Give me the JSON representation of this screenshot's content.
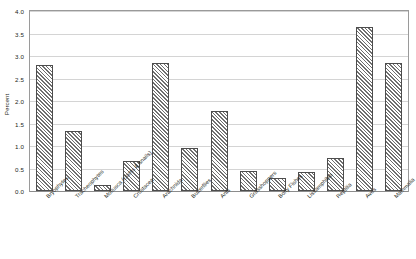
{
  "chart_data": {
    "type": "bar",
    "title": "",
    "xlabel": "",
    "ylabel": "Percent",
    "ylim": [
      0,
      4.0
    ],
    "ytick_step": 0.5,
    "grid": true,
    "legend": "none",
    "categories": [
      "Bryophytes",
      "Tracheophytes",
      "Mollusca (clams & snails)",
      "Crustacea",
      "Arachnida",
      "Butterflies",
      "Ants",
      "Grasshoppers",
      "Bony Fishes",
      "Lissamphibia",
      "Reptilia",
      "Aves",
      "Mammalia"
    ],
    "values": [
      2.81,
      1.33,
      0.13,
      0.67,
      2.85,
      0.95,
      1.78,
      0.44,
      0.3,
      0.42,
      0.74,
      3.65,
      2.85
    ],
    "ytick_labels": [
      "0.0",
      "0.5",
      "1.0",
      "1.5",
      "2.0",
      "2.5",
      "3.0",
      "3.5",
      "4.0"
    ],
    "ytick_values": [
      0.0,
      0.5,
      1.0,
      1.5,
      2.0,
      2.5,
      3.0,
      3.5,
      4.0
    ],
    "colors": {
      "bar_fill": "#ffffff",
      "bar_hatch": "#6f6f6f",
      "bar_edge": "#4d4d4d",
      "gridline": "#d4d4d4",
      "axis": "#9a9a9a",
      "text": "#231f20",
      "background": "#ffffff"
    }
  }
}
